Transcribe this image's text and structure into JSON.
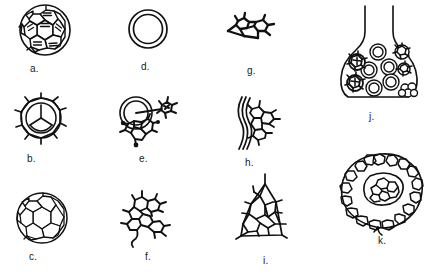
{
  "figure": {
    "width": 434,
    "height": 277,
    "background_color": "#ffffff",
    "ink_color": "#111111",
    "label_color": "#1a1a1a",
    "panels": [
      {
        "id": "a",
        "label": "a.",
        "caption_x": 30,
        "caption_y": 64,
        "art_x": 13,
        "art_y": 2,
        "art_w": 66,
        "art_h": 58,
        "icon": "fullerene-shaded-sphere",
        "description": "Closed cage buckyball sphere with hexagon and pentagon faces, several faces marked with double stripe hatching"
      },
      {
        "id": "b",
        "label": "b.",
        "caption_x": 27,
        "caption_y": 158,
        "art_x": 10,
        "art_y": 92,
        "art_w": 66,
        "art_h": 58,
        "icon": "cage-with-spikes",
        "description": "Circular cage outline with inner three-lobed cap and radiating bond spikes around the rim"
      },
      {
        "id": "c",
        "label": "c.",
        "caption_x": 29,
        "caption_y": 258,
        "art_x": 10,
        "art_y": 190,
        "art_w": 66,
        "art_h": 58,
        "icon": "plain-fullerene-sphere",
        "description": "Plain buckyball sphere, unshaded hexagon and pentagon net"
      },
      {
        "id": "d",
        "label": "d.",
        "caption_x": 141,
        "caption_y": 66,
        "art_x": 122,
        "art_y": 6,
        "art_w": 54,
        "art_h": 52,
        "icon": "double-ring-torus",
        "description": "Double concentric circle, a ring or nanotube cross section"
      },
      {
        "id": "e",
        "label": "e.",
        "caption_x": 139,
        "caption_y": 160,
        "art_x": 112,
        "art_y": 96,
        "art_w": 78,
        "art_h": 56,
        "icon": "ring-with-attached-cluster",
        "description": "Double ring with an attached small cage cluster at right and a ragged fragment with filled atom dots below"
      },
      {
        "id": "f",
        "label": "f.",
        "caption_x": 146,
        "caption_y": 258,
        "art_x": 115,
        "art_y": 188,
        "art_w": 72,
        "art_h": 62,
        "icon": "open-graphene-flake",
        "description": "Open flake of fused rings with dangling bonds and a curled tail at lower left"
      },
      {
        "id": "g",
        "label": "g.",
        "caption_x": 247,
        "caption_y": 68,
        "art_x": 222,
        "art_y": 10,
        "art_w": 68,
        "art_h": 42,
        "icon": "small-two-ring-fragment",
        "description": "Small fragment of two bonded rings lying flat with short dangling bonds"
      },
      {
        "id": "h",
        "label": "h.",
        "caption_x": 245,
        "caption_y": 161,
        "art_x": 224,
        "art_y": 95,
        "art_w": 72,
        "art_h": 62,
        "icon": "curved-ribbon-with-cluster",
        "description": "Curved double line ribbon with a small fused ring cluster growing at its right edge"
      },
      {
        "id": "i",
        "label": "i.",
        "caption_x": 265,
        "caption_y": 260,
        "art_x": 218,
        "art_y": 172,
        "art_w": 86,
        "art_h": 80,
        "icon": "conical-cap-lattice",
        "description": "Conical or trapezoidal cap built from a hexagonal lattice with dangling bonds around the edge"
      },
      {
        "id": "j",
        "label": "j.",
        "caption_x": 371,
        "caption_y": 116,
        "art_x": 332,
        "art_y": 4,
        "art_w": 98,
        "art_h": 106,
        "icon": "flask-with-particles",
        "description": "Erlenmeyer style flask containing round double-ring particles and several dark cage clusters"
      },
      {
        "id": "k",
        "label": "k.",
        "caption_x": 380,
        "caption_y": 238,
        "art_x": 334,
        "art_y": 152,
        "art_w": 96,
        "art_h": 84,
        "icon": "onion-shell-cluster",
        "description": "Large roughly circular onion-like cluster of fused rings with an inner core of small rings inside a shell"
      }
    ]
  }
}
